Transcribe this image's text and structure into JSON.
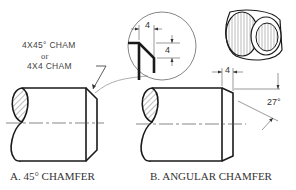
{
  "figure": {
    "panel_a": {
      "caption": "A. 45° CHAMFER",
      "note_line1": "4X45° CHAM",
      "note_line2": "or",
      "note_line3": "4X4  CHAM"
    },
    "panel_b": {
      "caption": "B. ANGULAR CHAMFER",
      "dim_length": "4",
      "dim_angle": "27°"
    },
    "detail_inset": {
      "dim_horizontal": "4",
      "dim_vertical": "4"
    },
    "colors": {
      "line": "#1a1a1a",
      "thin_line": "#555555",
      "background": "#ffffff"
    }
  }
}
